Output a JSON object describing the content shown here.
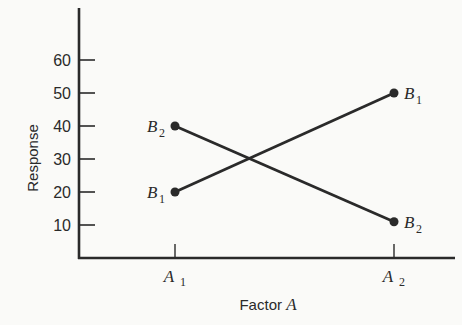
{
  "chart_data": {
    "type": "line",
    "title": "",
    "xlabel": "Factor A",
    "xlabel_parts": {
      "text": "Factor",
      "var": "A"
    },
    "ylabel": "Response",
    "categories": [
      "A1",
      "A2"
    ],
    "category_labels": [
      {
        "base": "A",
        "sub": "1"
      },
      {
        "base": "A",
        "sub": "2"
      }
    ],
    "yticks": [
      10,
      20,
      30,
      40,
      50,
      60
    ],
    "ylim": [
      0,
      70
    ],
    "grid": false,
    "series": [
      {
        "name": "B1",
        "label": {
          "base": "B",
          "sub": "1"
        },
        "values": [
          20,
          50
        ]
      },
      {
        "name": "B2",
        "label": {
          "base": "B",
          "sub": "2"
        },
        "values": [
          40,
          11
        ]
      }
    ],
    "color": "#2a2a2a"
  }
}
